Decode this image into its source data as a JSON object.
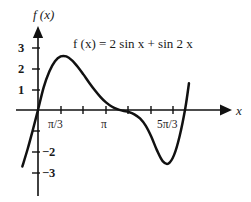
{
  "figure": {
    "equation_label": "f (x)  =  2 sin x + sin 2 x",
    "y_axis_label": "f (x)",
    "x_axis_label": "x",
    "curve_color": "#111111",
    "axis_color": "#111111",
    "background": "#ffffff"
  },
  "chart_data": {
    "type": "line",
    "title": "",
    "subtitle": "",
    "xlabel": "x",
    "ylabel": "f (x)",
    "annotations": [
      "f (x)  =  2 sin x + sin 2 x"
    ],
    "legend": [],
    "legend_position": "none",
    "grid": false,
    "xlim": [
      -0.23,
      2.22
    ],
    "ylim": [
      -3.6,
      3.3
    ],
    "xunit": "pi",
    "x_tick_labels": [
      "π/3",
      "π",
      "5π/3"
    ],
    "x_tick_values": [
      0.3333,
      1.0,
      1.6667
    ],
    "x_minor_ticks": [
      0.3333,
      0.6667,
      1.0,
      1.3333,
      1.6667,
      2.0
    ],
    "y_tick_labels": [
      "3",
      "2",
      "1",
      "−2",
      "−3"
    ],
    "y_tick_values": [
      3,
      2,
      1,
      -2,
      -3
    ],
    "y_minor_ticks": [
      3,
      2,
      1,
      -1,
      -2,
      -3
    ],
    "series": [
      {
        "name": "f(x) = 2 sin x + sin 2x",
        "expression": "2*sin(x) + sin(2*x)",
        "x": [
          -0.23,
          -0.15,
          -0.08,
          0.0,
          0.0833,
          0.1667,
          0.25,
          0.3333,
          0.4167,
          0.5,
          0.5833,
          0.6667,
          0.75,
          0.8333,
          0.9167,
          1.0,
          1.0833,
          1.1667,
          1.25,
          1.3333,
          1.4167,
          1.5,
          1.5833,
          1.6667,
          1.75,
          1.8333,
          1.9167,
          2.0,
          2.0833,
          2.1667,
          2.22
        ],
        "y": [
          -2.74,
          -1.87,
          -1.02,
          0.0,
          1.1,
          1.87,
          2.37,
          2.6,
          2.6,
          2.41,
          2.1,
          1.73,
          1.34,
          0.97,
          0.64,
          0.37,
          0.17,
          0.04,
          -0.04,
          -0.1,
          -0.21,
          -0.41,
          -0.76,
          -1.3,
          -1.96,
          -2.48,
          -2.6,
          -2.19,
          -1.26,
          0.1,
          1.3
        ],
        "peak": {
          "x": 0.375,
          "y": 2.6
        },
        "trough": {
          "x": 1.9,
          "y": -2.6
        },
        "zero_crossings": [
          0.0,
          1.0,
          2.0
        ]
      }
    ]
  }
}
